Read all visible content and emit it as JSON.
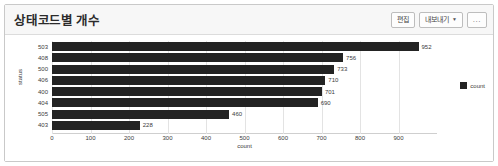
{
  "panel": {
    "title": "상태코드별 개수",
    "actions": [
      {
        "name": "edit-button",
        "label": "편집",
        "has_caret": false
      },
      {
        "name": "export-button",
        "label": "내보내기",
        "has_caret": true,
        "caret": "▼"
      },
      {
        "name": "more-options-button",
        "label": "...",
        "has_caret": false
      }
    ]
  },
  "chart_data": {
    "type": "bar",
    "orientation": "horizontal",
    "title": "상태코드별 개수",
    "xlabel": "count",
    "ylabel": "status",
    "categories": [
      "503",
      "408",
      "500",
      "406",
      "400",
      "404",
      "505",
      "403"
    ],
    "values": [
      952,
      756,
      733,
      710,
      701,
      690,
      460,
      228
    ],
    "value_labels": [
      "952",
      "756",
      "733",
      "710",
      "701",
      "690",
      "460",
      "228"
    ],
    "xlim": [
      0,
      1000
    ],
    "xticks": [
      0,
      100,
      200,
      300,
      400,
      500,
      600,
      700,
      800,
      900
    ],
    "xticklabels": [
      "0",
      "100",
      "200",
      "300",
      "400",
      "500",
      "600",
      "700",
      "800",
      "900"
    ],
    "grid": true,
    "grid_axis": "x",
    "legend": {
      "position": "right",
      "entries": [
        {
          "label": "count",
          "color": "#232323"
        }
      ]
    },
    "series": [
      {
        "name": "count",
        "color": "#232323",
        "values": [
          952,
          756,
          733,
          710,
          701,
          690,
          460,
          228
        ]
      }
    ]
  },
  "colors": {
    "bar": "#232323",
    "grid": "#e3e3e3",
    "panel_border": "#c9c9c9",
    "header_bg": "#f7f7f7",
    "text": "#3a3a3a"
  }
}
